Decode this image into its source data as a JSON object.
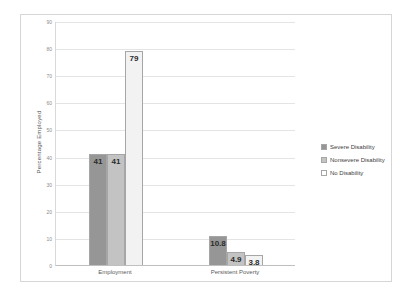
{
  "chart_data": {
    "type": "bar",
    "title": "",
    "subtitle": "",
    "xlabel": "",
    "ylabel": "Percentage Employed",
    "categories": [
      "Employment",
      "Persistent Poverty"
    ],
    "series": [
      {
        "name": "Severe Disability",
        "values": [
          41,
          10.8
        ],
        "color": "#969696",
        "swatch": "#969696"
      },
      {
        "name": "Nonsevere Disability",
        "values": [
          41,
          4.9
        ],
        "color": "#c3c3c3",
        "swatch": "#c3c3c3"
      },
      {
        "name": "No Disability",
        "values": [
          79,
          3.8
        ],
        "color": "#f2f2f2",
        "swatch": "#ffffff"
      }
    ],
    "data_labels": [
      [
        "41",
        "41",
        "79"
      ],
      [
        "10.8",
        "4.9",
        "3.8"
      ]
    ],
    "ylim": [
      0,
      90
    ],
    "ytick_step": 10,
    "yticks": [
      0,
      10,
      20,
      30,
      40,
      50,
      60,
      70,
      80,
      90
    ],
    "ytick_labels": [
      "0",
      "10",
      "20",
      "30",
      "40",
      "50",
      "60",
      "70",
      "80",
      "90"
    ],
    "grid": true,
    "legend_position": "right",
    "bar_border_color": "#a6a6a6",
    "gridline_color": "#e4e4e4",
    "axis_color": "#bfbfbf",
    "frame_color": "#d6d6d6",
    "background": "#ffffff"
  }
}
